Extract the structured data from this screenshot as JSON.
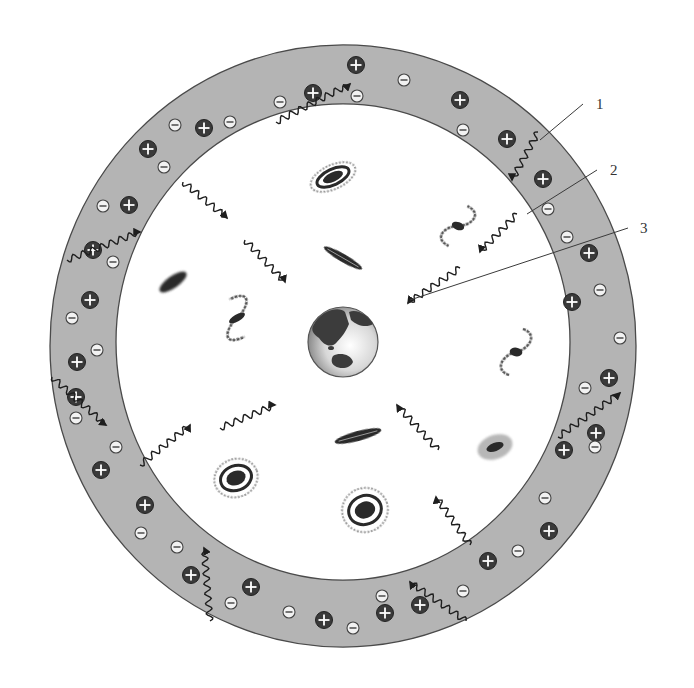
{
  "diagram": {
    "colors": {
      "background": "#ffffff",
      "ring_fill": "#b4b4b4",
      "ring_stroke": "#4a4a4a",
      "plus_fill": "#3a3a3a",
      "minus_fill": "#f2f2f2",
      "wave": "#1e1e1e",
      "leader_line": "#3a3a3a",
      "galaxy": "#2a2a2a"
    },
    "ring": {
      "cx": 343,
      "cy": 346,
      "outer_rx": 293,
      "outer_ry": 301,
      "inner_rx": 227,
      "inner_ry": 238
    },
    "earth": {
      "cx": 343,
      "cy": 342,
      "r": 35,
      "label": "Earth"
    },
    "callouts": [
      {
        "id": "1",
        "text": "1",
        "x": 596,
        "y": 104,
        "line": [
          583,
          104,
          540,
          140
        ]
      },
      {
        "id": "2",
        "text": "2",
        "x": 610,
        "y": 170,
        "line": [
          597,
          170,
          527,
          214
        ]
      },
      {
        "id": "3",
        "text": "3",
        "x": 640,
        "y": 228,
        "line": [
          628,
          228,
          410,
          300
        ]
      }
    ],
    "plus_charges": [
      [
        356,
        65
      ],
      [
        313,
        93
      ],
      [
        460,
        100
      ],
      [
        204,
        128
      ],
      [
        148,
        149
      ],
      [
        507,
        139
      ],
      [
        129,
        205
      ],
      [
        543,
        179
      ],
      [
        93,
        250
      ],
      [
        589,
        253
      ],
      [
        90,
        300
      ],
      [
        572,
        302
      ],
      [
        77,
        362
      ],
      [
        76,
        397
      ],
      [
        609,
        378
      ],
      [
        596,
        433
      ],
      [
        564,
        450
      ],
      [
        101,
        470
      ],
      [
        145,
        505
      ],
      [
        549,
        531
      ],
      [
        488,
        561
      ],
      [
        191,
        575
      ],
      [
        251,
        587
      ],
      [
        420,
        605
      ],
      [
        324,
        620
      ],
      [
        385,
        613
      ]
    ],
    "minus_charges": [
      [
        230,
        122
      ],
      [
        175,
        125
      ],
      [
        280,
        102
      ],
      [
        404,
        80
      ],
      [
        463,
        130
      ],
      [
        357,
        96
      ],
      [
        164,
        167
      ],
      [
        103,
        206
      ],
      [
        113,
        262
      ],
      [
        567,
        237
      ],
      [
        548,
        209
      ],
      [
        600,
        290
      ],
      [
        72,
        318
      ],
      [
        97,
        350
      ],
      [
        620,
        338
      ],
      [
        76,
        418
      ],
      [
        585,
        388
      ],
      [
        595,
        447
      ],
      [
        116,
        447
      ],
      [
        545,
        498
      ],
      [
        518,
        551
      ],
      [
        141,
        533
      ],
      [
        177,
        547
      ],
      [
        231,
        603
      ],
      [
        289,
        612
      ],
      [
        382,
        596
      ],
      [
        353,
        628
      ],
      [
        463,
        591
      ]
    ],
    "waves": [
      {
        "name": "wave-top-left-outer",
        "from": [
          276,
          122
        ],
        "to": [
          350,
          84
        ],
        "in_ring": true
      },
      {
        "name": "wave-left-outer",
        "from": [
          67,
          260
        ],
        "to": [
          140,
          232
        ],
        "in_ring": true
      },
      {
        "name": "wave-left-down",
        "from": [
          52,
          377
        ],
        "to": [
          106,
          425
        ],
        "in_ring": true
      },
      {
        "name": "wave-top-right-in",
        "from": [
          538,
          132
        ],
        "to": [
          512,
          180
        ],
        "in_ring": true
      },
      {
        "name": "wave-right-outer",
        "from": [
          558,
          437
        ],
        "to": [
          620,
          393
        ],
        "in_ring": true
      },
      {
        "name": "wave-bottom-left-up",
        "from": [
          210,
          621
        ],
        "to": [
          204,
          548
        ],
        "in_ring": true
      },
      {
        "name": "wave-bottom-right",
        "from": [
          466,
          621
        ],
        "to": [
          410,
          582
        ],
        "in_ring": true
      },
      {
        "name": "wave-in-1",
        "from": [
          183,
          182
        ],
        "to": [
          227,
          218
        ],
        "in_ring": false
      },
      {
        "name": "wave-in-2",
        "from": [
          245,
          240
        ],
        "to": [
          285,
          282
        ],
        "in_ring": false
      },
      {
        "name": "wave-in-3",
        "from": [
          517,
          214
        ],
        "to": [
          480,
          252
        ],
        "in_ring": false
      },
      {
        "name": "wave-in-4",
        "from": [
          460,
          268
        ],
        "to": [
          408,
          303
        ],
        "in_ring": false
      },
      {
        "name": "wave-out-1",
        "from": [
          220,
          428
        ],
        "to": [
          275,
          405
        ],
        "in_ring": false
      },
      {
        "name": "wave-out-2",
        "from": [
          140,
          465
        ],
        "to": [
          190,
          425
        ],
        "in_ring": false
      },
      {
        "name": "wave-in-5",
        "from": [
          438,
          450
        ],
        "to": [
          397,
          405
        ],
        "in_ring": false
      },
      {
        "name": "wave-in-6",
        "from": [
          470,
          545
        ],
        "to": [
          436,
          497
        ],
        "in_ring": false
      }
    ],
    "galaxies": [
      {
        "name": "galaxy-spiral-top",
        "type": "spiral",
        "cx": 333,
        "cy": 177,
        "rx": 24,
        "ry": 12,
        "rot": -25
      },
      {
        "name": "galaxy-edge-on-top",
        "type": "edgeon",
        "cx": 343,
        "cy": 258,
        "rx": 22,
        "ry": 4,
        "rot": 30
      },
      {
        "name": "galaxy-spiral-right-top",
        "type": "spiral-open",
        "cx": 458,
        "cy": 226,
        "rx": 20,
        "ry": 22,
        "rot": 20
      },
      {
        "name": "galaxy-elliptical-left",
        "type": "elliptical",
        "cx": 173,
        "cy": 282,
        "rx": 16,
        "ry": 6,
        "rot": -35
      },
      {
        "name": "galaxy-spiral-left",
        "type": "spiral-open",
        "cx": 237,
        "cy": 318,
        "rx": 28,
        "ry": 20,
        "rot": -30
      },
      {
        "name": "galaxy-spiral-right",
        "type": "spiral-open",
        "cx": 516,
        "cy": 352,
        "rx": 20,
        "ry": 24,
        "rot": 10
      },
      {
        "name": "galaxy-edge-on-bottom",
        "type": "edgeon",
        "cx": 358,
        "cy": 436,
        "rx": 24,
        "ry": 5,
        "rot": -15
      },
      {
        "name": "galaxy-irregular",
        "type": "irregular",
        "cx": 495,
        "cy": 447,
        "rx": 18,
        "ry": 12,
        "rot": -20
      },
      {
        "name": "galaxy-spiral-bottom-left",
        "type": "spiral",
        "cx": 236,
        "cy": 478,
        "rx": 22,
        "ry": 19,
        "rot": -20
      },
      {
        "name": "galaxy-spiral-bottom",
        "type": "spiral",
        "cx": 365,
        "cy": 510,
        "rx": 23,
        "ry": 22,
        "rot": -20
      }
    ]
  }
}
